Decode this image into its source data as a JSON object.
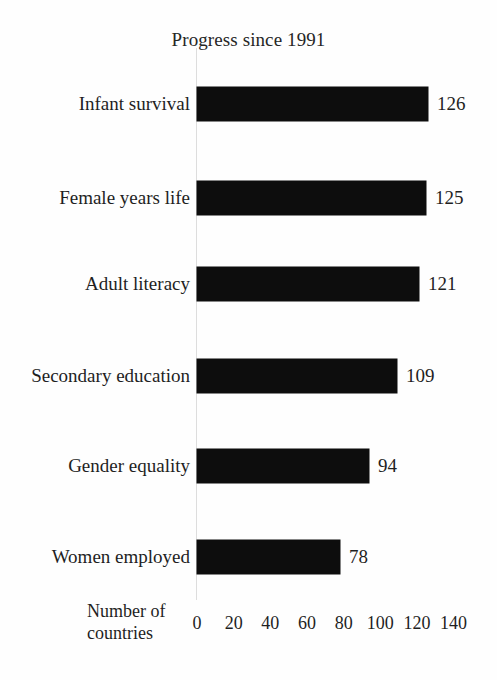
{
  "chart_data": {
    "type": "bar",
    "orientation": "horizontal",
    "title": "Progress since 1991",
    "xlabel": "Number of countries",
    "xlabel_lines": [
      "Number of",
      "countries"
    ],
    "ylabel": "",
    "categories": [
      "Infant survival",
      "Female years life",
      "Adult literacy",
      "Secondary education",
      "Gender equality",
      "Women employed"
    ],
    "values": [
      126,
      125,
      121,
      109,
      94,
      78
    ],
    "value_labels": [
      "126",
      "125",
      "121",
      "109",
      "94",
      "78"
    ],
    "xlim": [
      0,
      140
    ],
    "xticks": [
      0,
      20,
      40,
      60,
      80,
      100,
      120,
      140
    ],
    "xtick_labels": [
      "0",
      "20",
      "40",
      "60",
      "80",
      "100",
      "120",
      "140"
    ],
    "grid": false,
    "legend": false,
    "bar_color": "#0d0d0d",
    "background_color": "#fefefe",
    "axis_line_color": "#dddddd"
  }
}
